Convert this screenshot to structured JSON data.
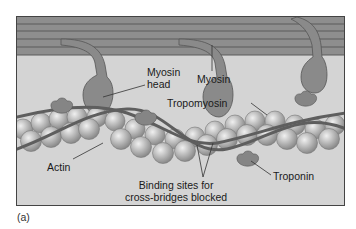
{
  "figure": {
    "caption": "(a)",
    "labels": {
      "myosin_head_line1": "Myosin",
      "myosin_head_line2": "head",
      "myosin": "Myosin",
      "tropomyosin": "Tropomyosin",
      "actin": "Actin",
      "binding_sites_line1": "Binding sites for",
      "binding_sites_line2": "cross-bridges blocked",
      "troponin": "Troponin"
    },
    "colors": {
      "background": "#d4d4d4",
      "thick_filament": "#8e8e8e",
      "thick_filament_line": "#5a5a5a",
      "myosin_head": "#8a8a8a",
      "actin_bead": "#bdbdbd",
      "tropomyosin": "#6a6a6a",
      "troponin": "#858585",
      "frame": "#444444"
    }
  }
}
